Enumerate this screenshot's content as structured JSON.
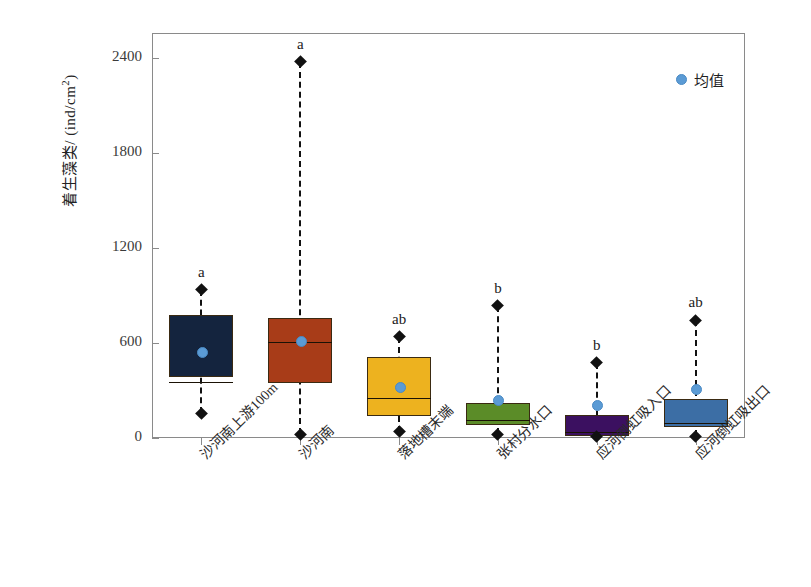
{
  "chart_data": {
    "type": "box",
    "title": "",
    "xlabel": "",
    "ylabel": "着生藻类/(ind/cm²)",
    "ylabel_main": "着生藻类/ (ind/cm",
    "ylabel_sup": "2",
    "ylabel_tail": ")",
    "ylim": [
      0,
      2520
    ],
    "yticks": [
      0,
      600,
      1200,
      1800,
      2400
    ],
    "ytick_labels": [
      "0",
      "600",
      "1200",
      "1800",
      "2400"
    ],
    "grid": false,
    "legend": {
      "position": "top-right",
      "entries": [
        {
          "label": "均值",
          "marker": "circle",
          "color": "#5b9bd5"
        }
      ]
    },
    "categories": [
      "沙河南上游100m",
      "沙河南",
      "落地槽末端",
      "张村分水口",
      "应河倒虹吸入口",
      "应河倒虹吸出口"
    ],
    "significance_letters": [
      "a",
      "a",
      "ab",
      "b",
      "b",
      "ab"
    ],
    "box_colors": [
      "#14243e",
      "#a83c18",
      "#edb21f",
      "#5b8c28",
      "#3b1060",
      "#3c6ea5"
    ],
    "boxes": [
      {
        "category": "沙河南上游100m",
        "whisker_low": 155,
        "q1": 385,
        "median": 355,
        "q3": 780,
        "whisker_high": 935,
        "mean": 545,
        "letter": "a",
        "color": "#14243e"
      },
      {
        "category": "沙河南",
        "whisker_low": 25,
        "q1": 345,
        "median": 605,
        "q3": 760,
        "whisker_high": 2375,
        "mean": 610,
        "letter": "a",
        "color": "#a83c18"
      },
      {
        "category": "落地槽末端",
        "whisker_low": 40,
        "q1": 140,
        "median": 252,
        "q3": 512,
        "whisker_high": 640,
        "mean": 322,
        "letter": "ab",
        "color": "#edb21f"
      },
      {
        "category": "张村分水口",
        "whisker_low": 25,
        "q1": 80,
        "median": 115,
        "q3": 220,
        "whisker_high": 835,
        "mean": 240,
        "letter": "b",
        "color": "#5b8c28"
      },
      {
        "category": "应河倒虹吸入口",
        "whisker_low": 10,
        "q1": 10,
        "median": 40,
        "q3": 145,
        "whisker_high": 475,
        "mean": 210,
        "letter": "b",
        "color": "#3b1060"
      },
      {
        "category": "应河倒虹吸出口",
        "whisker_low": 12,
        "q1": 70,
        "median": 95,
        "q3": 245,
        "whisker_high": 745,
        "mean": 310,
        "letter": "ab",
        "color": "#3c6ea5"
      }
    ]
  }
}
